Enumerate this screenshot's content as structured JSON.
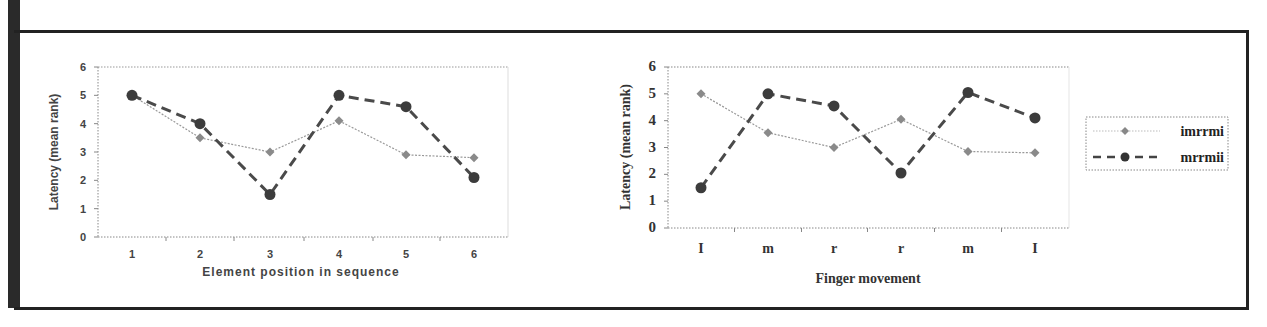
{
  "chart_data": [
    {
      "type": "line",
      "title": "",
      "xlabel": "Element position in sequence",
      "ylabel": "Latency (mean rank)",
      "categories": [
        "1",
        "2",
        "3",
        "4",
        "5",
        "6"
      ],
      "ylim": [
        0,
        6
      ],
      "yticks": [
        "0",
        "1",
        "2",
        "3",
        "4",
        "5",
        "6"
      ],
      "grid": false,
      "series": [
        {
          "name": "imrrmi",
          "values": [
            5.0,
            3.5,
            3.0,
            4.1,
            2.9,
            2.8
          ],
          "style": "dotted-thin",
          "marker": "diamond"
        },
        {
          "name": "mrrmii",
          "values": [
            5.0,
            4.0,
            1.5,
            5.0,
            4.6,
            2.1
          ],
          "style": "dashed-thick",
          "marker": "circle"
        }
      ]
    },
    {
      "type": "line",
      "title": "",
      "xlabel": "Finger movement",
      "ylabel": "Latency (mean rank)",
      "categories": [
        "I",
        "m",
        "r",
        "r",
        "m",
        "I"
      ],
      "ylim": [
        0,
        6
      ],
      "yticks": [
        "0",
        "1",
        "2",
        "3",
        "4",
        "5",
        "6"
      ],
      "grid": false,
      "legend_position": "right",
      "series": [
        {
          "name": "imrrmi",
          "values": [
            5.0,
            3.55,
            3.0,
            4.05,
            2.85,
            2.8
          ],
          "style": "dotted-thin",
          "marker": "diamond"
        },
        {
          "name": "mrrmii",
          "values": [
            1.5,
            5.0,
            4.55,
            2.05,
            5.05,
            4.1
          ],
          "style": "dashed-thick",
          "marker": "circle"
        }
      ]
    }
  ],
  "legend": {
    "items": [
      {
        "label": "imrrmi"
      },
      {
        "label": "mrrmii"
      }
    ]
  },
  "colors": {
    "series_light": "#8a8a8a",
    "series_dark": "#3c3c3c",
    "frame": "#222222"
  }
}
